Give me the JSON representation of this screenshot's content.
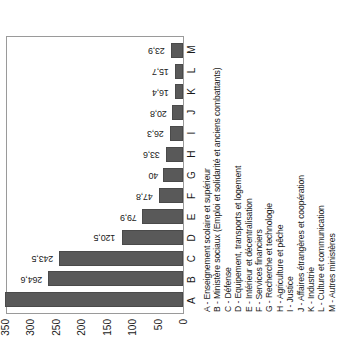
{
  "chart_data": {
    "type": "bar",
    "title": "",
    "subtitle": "",
    "xlabel": "",
    "ylabel": "",
    "categories": [
      "A",
      "B",
      "C",
      "D",
      "E",
      "F",
      "G",
      "H",
      "I",
      "J",
      "K",
      "L",
      "M"
    ],
    "values": [
      349.3,
      264.6,
      243.5,
      120.5,
      79.9,
      47.8,
      40,
      33.6,
      26.3,
      20.8,
      16.4,
      15.7,
      23.9
    ],
    "value_labels": [
      "349,3",
      "264,6",
      "243,5",
      "120,5",
      "79,9",
      "47,8",
      "40",
      "33,6",
      "26,3",
      "20,8",
      "16,4",
      "15,7",
      "23,9"
    ],
    "ylim": [
      0,
      350
    ],
    "yticks": [
      350,
      300,
      250,
      200,
      150,
      100,
      50,
      0
    ],
    "ytick_labels": [
      "350",
      "300",
      "250",
      "200",
      "150",
      "100",
      "50",
      "0"
    ],
    "grid": false,
    "legend_position": "below-axis",
    "bar_color": "#595959",
    "axis_color": "#9a9a9a",
    "text_color": "#1a1a1a",
    "legend": [
      "A - Enseignement scolaire et supérieur",
      "B - Ministère sociaux (Emploi et solidarité et anciens combattants)",
      "C - Défense",
      "D - Equipement, transports et logement",
      "E - Intérieur et décentralisation",
      "F - Services financiers",
      "G - Recherche et technologie",
      "H - Agriculture et pêche",
      "I - Justice",
      "J - Affaires étrangères et coopération",
      "K - Industrie",
      "L - Culture et communication",
      "M - Autres ministères"
    ]
  }
}
